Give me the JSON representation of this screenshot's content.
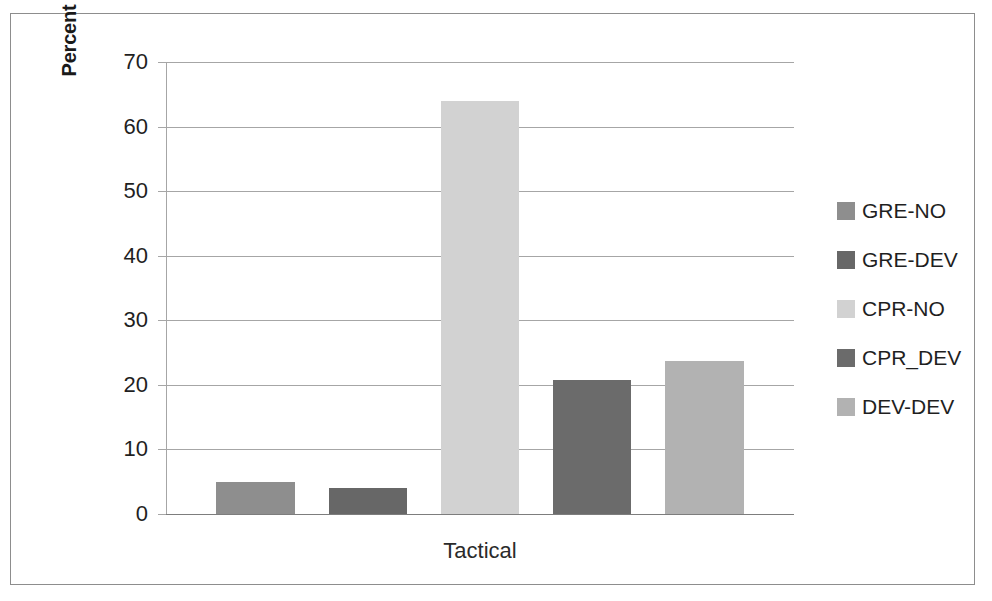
{
  "chart_data": {
    "type": "bar",
    "title": "",
    "subtitle": "",
    "categories": [
      "Tactical"
    ],
    "xlabel": "Tactical",
    "ylabel": "Percent participants in mode",
    "ylim": [
      0,
      70
    ],
    "ytick_step": 10,
    "yticks": [
      70,
      60,
      50,
      40,
      30,
      20,
      10,
      0
    ],
    "ytick_labels": [
      "70",
      "60",
      "50",
      "40",
      "30",
      "20",
      "10",
      "0"
    ],
    "grid": true,
    "legend_position": "right",
    "series": [
      {
        "name": "GRE-NO",
        "values": [
          5
        ],
        "color": "#8e8e8e"
      },
      {
        "name": "GRE-DEV",
        "values": [
          4
        ],
        "color": "#676767"
      },
      {
        "name": "CPR-NO",
        "values": [
          64
        ],
        "color": "#d2d2d2"
      },
      {
        "name": "CPR_DEV",
        "values": [
          20.8
        ],
        "color": "#6b6b6b"
      },
      {
        "name": "DEV-DEV",
        "values": [
          23.7
        ],
        "color": "#b2b2b2"
      }
    ]
  },
  "axis": {
    "y_title": "Percent participants in mode",
    "x_category": "Tactical",
    "tick_labels": [
      "70",
      "60",
      "50",
      "40",
      "30",
      "20",
      "10",
      "0"
    ]
  },
  "legend": {
    "items": [
      {
        "label": "GRE-NO",
        "color": "#8e8e8e"
      },
      {
        "label": "GRE-DEV",
        "color": "#676767"
      },
      {
        "label": "CPR-NO",
        "color": "#d2d2d2"
      },
      {
        "label": "CPR_DEV",
        "color": "#6b6b6b"
      },
      {
        "label": "DEV-DEV",
        "color": "#b2b2b2"
      }
    ]
  },
  "colors": {
    "frame": "#8d8d8d",
    "gridline": "#a6a6a6",
    "baseline": "#7d7d7d",
    "text": "#1f1f1f"
  }
}
